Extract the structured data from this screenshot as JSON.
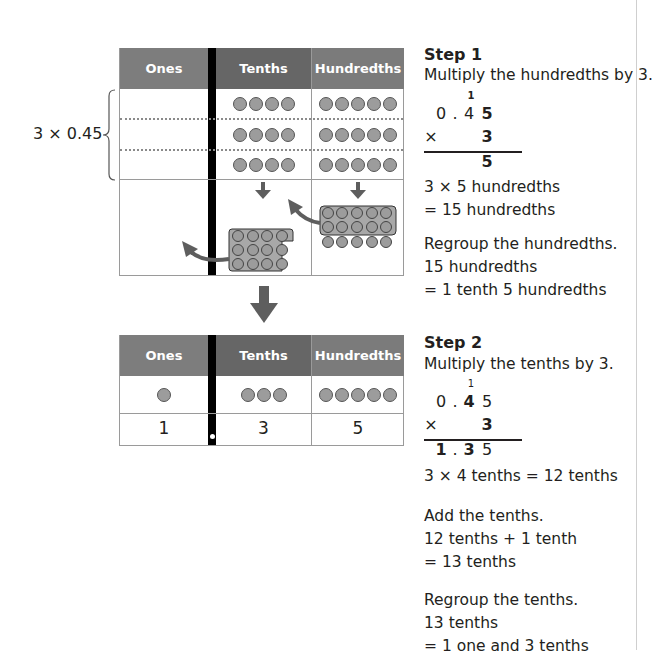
{
  "table_headers": {
    "ones": "Ones",
    "tenths": "Tenths",
    "hundredths": "Hundredths"
  },
  "top_table": {
    "brace_label": "3 × 0.45",
    "rows": [
      {
        "ones_dots": 0,
        "tenths_dots": 4,
        "hundredths_dots": 5
      },
      {
        "ones_dots": 0,
        "tenths_dots": 4,
        "hundredths_dots": 5
      },
      {
        "ones_dots": 0,
        "tenths_dots": 4,
        "hundredths_dots": 5
      }
    ],
    "regroup_row": {
      "tenths_group": "12 tenths grouped (10 boxed + 2)",
      "hundredths_group": "10 hundredths boxed + 5 remaining"
    }
  },
  "bottom_table": {
    "dots": {
      "ones": 1,
      "tenths": 3,
      "hundredths": 5
    },
    "digits": {
      "ones": "1",
      "tenths": "3",
      "hundredths": "5"
    }
  },
  "step1": {
    "title": "Step 1",
    "instruction": "Multiply the hundredths by 3.",
    "calc": {
      "carry": "1",
      "top": [
        "0",
        ".",
        "4",
        "5"
      ],
      "mult_sign": "×",
      "multiplier": "3",
      "result": "5"
    },
    "lines": [
      "3 × 5 hundredths",
      "= 15 hundredths"
    ],
    "regroup": [
      "Regroup the hundredths.",
      "15 hundredths",
      "= 1 tenth 5 hundredths"
    ]
  },
  "step2": {
    "title": "Step 2",
    "instruction": "Multiply the tenths by 3.",
    "calc": {
      "carry": "1",
      "top": [
        "0",
        ".",
        "4",
        "5"
      ],
      "mult_sign": "×",
      "multiplier": "3",
      "result": [
        "1",
        ".",
        "3",
        "5"
      ]
    },
    "line1": "3 × 4 tenths = 12 tenths",
    "add": [
      "Add the tenths.",
      "12 tenths + 1 tenth",
      "= 13 tenths"
    ],
    "regroup": [
      "Regroup the tenths.",
      "13 tenths",
      "= 1 one and 3 tenths"
    ]
  },
  "colors": {
    "header_dark": "#666666",
    "header_light": "#7d7d7d",
    "counter_fill": "#9c9c9c",
    "arrow": "#5e5e5e",
    "group_fill": "#a8a8a8"
  }
}
